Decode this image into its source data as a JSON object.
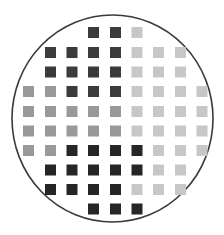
{
  "wafer": {
    "circle": {
      "cx": 112.5,
      "cy": 118.5,
      "rx": 100.5,
      "ry": 103.5,
      "stroke": "#3a3a3a"
    },
    "grid": {
      "col_x": [
        23,
        45,
        66.5,
        88,
        110,
        131.5,
        153,
        175,
        196.5
      ],
      "row_y": [
        27,
        47,
        66.5,
        86,
        106,
        125.5,
        145,
        164.5,
        184,
        203.5
      ],
      "cell_w": 11,
      "cell_h": 11
    },
    "colors": {
      "D": "#3b3b3b",
      "K": "#262626",
      "M": "#999999",
      "L": "#c7c7c7"
    },
    "rows": [
      "...DDL...",
      ".DDDDLLL.",
      ".DDDDLLL.",
      "MMDDDLLLL",
      "MMMMMLLLL",
      "MMMMMLLLL",
      "MMKKKKLLL",
      ".KKKKKLL.",
      ".KKKKLLL.",
      "...KKK..."
    ]
  }
}
